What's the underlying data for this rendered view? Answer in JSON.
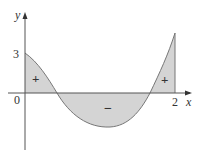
{
  "figure": {
    "axes": {
      "x_label": "x",
      "y_label": "y",
      "origin_label": "0",
      "x_tick_label": "2",
      "y_tick_label": "3"
    },
    "regions": [
      {
        "sign": "+",
        "position": "left, above axis"
      },
      {
        "sign": "−",
        "position": "middle, below axis"
      },
      {
        "sign": "+",
        "position": "right, above axis"
      }
    ],
    "colors": {
      "fill": "#d4d4d4",
      "curve": "#777777",
      "axis": "#555555",
      "text": "#333333"
    }
  }
}
